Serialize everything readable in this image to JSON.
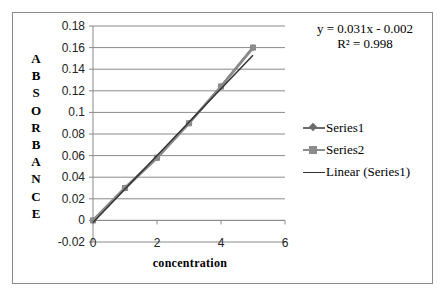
{
  "chart_data": {
    "type": "scatter",
    "title": "",
    "xlabel": "concentration",
    "ylabel": "ABSORBANCE",
    "xlim": [
      0,
      6
    ],
    "ylim": [
      -0.02,
      0.18
    ],
    "x_ticks": [
      "0",
      "2",
      "4",
      "6"
    ],
    "y_ticks": [
      "0.18",
      "0.16",
      "0.14",
      "0.12",
      "0.1",
      "0.08",
      "0.06",
      "0.04",
      "0.02",
      "0",
      "-0.02"
    ],
    "grid": "horizontal major gridlines",
    "legend_position": "right",
    "series": [
      {
        "name": "Series1",
        "marker": "diamond",
        "color": "#6b6b6b",
        "x": [
          0,
          1,
          2,
          3,
          4,
          5
        ],
        "y": [
          0,
          0.03,
          0.058,
          0.09,
          0.124,
          0.16
        ]
      },
      {
        "name": "Series2",
        "marker": "square",
        "color": "#8c8c8c",
        "x": [
          0,
          1,
          2,
          3,
          4,
          5
        ],
        "y": [
          0,
          0.03,
          0.058,
          0.09,
          0.124,
          0.16
        ]
      },
      {
        "name": "Linear (Series1)",
        "type": "trendline",
        "color": "#333333",
        "slope": 0.031,
        "intercept": -0.002,
        "x": [
          0,
          5
        ],
        "y": [
          -0.002,
          0.153
        ]
      }
    ],
    "annotations": [
      "y = 0.031x - 0.002",
      "R² = 0.998"
    ]
  },
  "chart": {
    "equation": "y = 0.031x - 0.002",
    "r_squared": "R² = 0.998",
    "xlabel": "concentration",
    "ylabel_letters": [
      "A",
      "B",
      "S",
      "O",
      "R",
      "B",
      "A",
      "N",
      "C",
      "E"
    ],
    "legend": [
      {
        "label": "Series1"
      },
      {
        "label": "Series2"
      },
      {
        "label": "Linear (Series1)"
      }
    ]
  }
}
